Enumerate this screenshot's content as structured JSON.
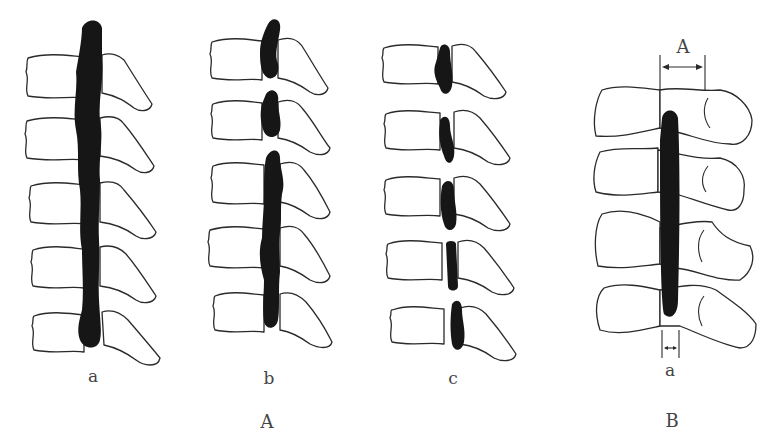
{
  "figure": {
    "panel_A": {
      "label": "A",
      "subfigures": [
        {
          "label": "a",
          "description": "continuous ossification spanning five vertebrae"
        },
        {
          "label": "b",
          "description": "mixed ossification: two segmental pieces above a continuous segment"
        },
        {
          "label": "c",
          "description": "segmental ossification behind each vertebral body"
        }
      ]
    },
    "panel_B": {
      "label": "B",
      "dimension_A_label": "A",
      "dimension_a_label": "a",
      "description": "measurement of canal diameter (A) and ossification thickness (a)"
    }
  }
}
